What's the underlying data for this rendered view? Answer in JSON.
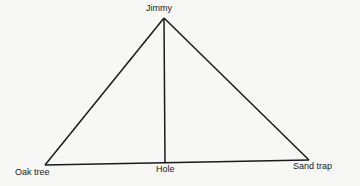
{
  "diagram": {
    "type": "triangle",
    "points": {
      "jimmy": {
        "label": "Jimmy",
        "x": 164,
        "y": 18
      },
      "oak_tree": {
        "label": "Oak tree",
        "x": 45,
        "y": 165
      },
      "hole": {
        "label": "Hole",
        "x": 165,
        "y": 163
      },
      "sand_trap": {
        "label": "Sand trap",
        "x": 309,
        "y": 160
      }
    },
    "segments": [
      [
        "jimmy",
        "oak_tree"
      ],
      [
        "jimmy",
        "sand_trap"
      ],
      [
        "oak_tree",
        "sand_trap"
      ],
      [
        "jimmy",
        "hole"
      ]
    ],
    "line_color": "#1a1a1a"
  }
}
